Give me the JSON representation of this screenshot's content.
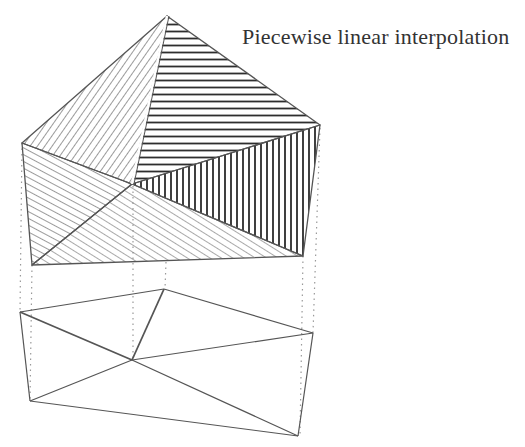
{
  "title": "Piecewise linear interpolation",
  "colors": {
    "line": "#555555",
    "hatch_light": "#777777",
    "hatch_dark": "#333333",
    "dotted": "#999999",
    "background": "#ffffff"
  },
  "surface": {
    "vertices": {
      "top": [
        167,
        16
      ],
      "right": [
        320,
        125
      ],
      "left": [
        22,
        143
      ],
      "center": [
        132,
        184
      ],
      "bottom_left": [
        32,
        265
      ],
      "bottom_right": [
        303,
        256
      ]
    },
    "faces": [
      {
        "name": "upper-left-face",
        "verts": [
          "top",
          "left",
          "center"
        ],
        "hatch": "diagonal-steep"
      },
      {
        "name": "upper-right-face",
        "verts": [
          "top",
          "right",
          "center"
        ],
        "hatch": "horizontal"
      },
      {
        "name": "right-face",
        "verts": [
          "right",
          "center",
          "bottom_right"
        ],
        "hatch": "vertical"
      },
      {
        "name": "left-face",
        "verts": [
          "left",
          "center",
          "bottom_left"
        ],
        "hatch": "diagonal-steep"
      },
      {
        "name": "bottom-face",
        "verts": [
          "center",
          "bottom_left",
          "bottom_right"
        ],
        "hatch": "diagonal-shallow"
      }
    ]
  },
  "mesh": {
    "vertices": {
      "top": [
        164,
        289
      ],
      "right": [
        313,
        333
      ],
      "left": [
        20,
        312
      ],
      "center": [
        132,
        360
      ],
      "bottom_left": [
        30,
        401
      ],
      "bottom_right": [
        298,
        436
      ]
    },
    "edges": [
      [
        "left",
        "top"
      ],
      [
        "top",
        "right"
      ],
      [
        "left",
        "center"
      ],
      [
        "top",
        "center"
      ],
      [
        "right",
        "center"
      ],
      [
        "left",
        "bottom_left"
      ],
      [
        "center",
        "bottom_left"
      ],
      [
        "center",
        "bottom_right"
      ],
      [
        "right",
        "bottom_right"
      ],
      [
        "bottom_left",
        "bottom_right"
      ]
    ]
  },
  "projections": [
    {
      "from": [
        22,
        143
      ],
      "to": [
        20,
        312
      ]
    },
    {
      "from": [
        32,
        265
      ],
      "to": [
        30,
        401
      ]
    },
    {
      "from": [
        133,
        186
      ],
      "to": [
        133,
        360
      ]
    },
    {
      "from": [
        166,
        262
      ],
      "to": [
        165,
        289
      ]
    },
    {
      "from": [
        320,
        128
      ],
      "to": [
        313,
        333
      ]
    },
    {
      "from": [
        303,
        256
      ],
      "to": [
        300,
        436
      ]
    }
  ]
}
